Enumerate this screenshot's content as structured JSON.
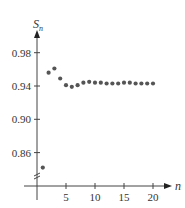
{
  "chart_data": {
    "type": "scatter",
    "title": "",
    "xlabel": "n",
    "ylabel": "S_n",
    "ylabel_main": "S",
    "ylabel_sub": "n",
    "x_ticks": [
      "5",
      "10",
      "15",
      "20"
    ],
    "y_ticks": [
      "0.98",
      "0.94",
      "0.90",
      "0.86"
    ],
    "ylim": [
      0.83,
      1.0
    ],
    "xlim": [
      0,
      21
    ],
    "axis_break": true,
    "grid": false,
    "series": [
      {
        "name": "S_n",
        "color": "#555555",
        "x": [
          1,
          2,
          3,
          4,
          5,
          6,
          7,
          8,
          9,
          10,
          11,
          12,
          13,
          14,
          15,
          16,
          17,
          18,
          19,
          20
        ],
        "values": [
          0.842,
          0.956,
          0.961,
          0.949,
          0.941,
          0.939,
          0.941,
          0.944,
          0.945,
          0.944,
          0.944,
          0.943,
          0.943,
          0.943,
          0.944,
          0.944,
          0.943,
          0.943,
          0.943,
          0.943
        ]
      }
    ]
  }
}
